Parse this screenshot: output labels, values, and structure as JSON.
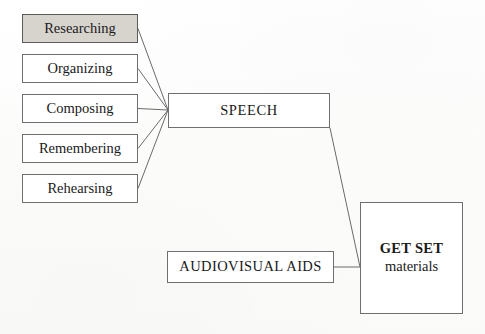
{
  "diagram": {
    "type": "flow-diagram",
    "background_color": "#fdfdfc",
    "line_color": "#6b6b6b",
    "border_color": "#6f6f6f",
    "shaded_fill_color": "#d7d4ce",
    "text_color": "#1a1a1a",
    "stages": [
      {
        "id": "researching",
        "label": "Researching",
        "shaded": true
      },
      {
        "id": "organizing",
        "label": "Organizing",
        "shaded": false
      },
      {
        "id": "composing",
        "label": "Composing",
        "shaded": false
      },
      {
        "id": "remembering",
        "label": "Remembering",
        "shaded": false
      },
      {
        "id": "rehearsing",
        "label": "Rehearsing",
        "shaded": false
      }
    ],
    "speech": {
      "id": "speech",
      "label": "SPEECH"
    },
    "audiovisual": {
      "id": "audiovisual-aids",
      "label": "AUDIOVISUAL AIDS"
    },
    "outcome": {
      "id": "get-set-materials",
      "title": "GET SET",
      "subtitle": "materials"
    }
  }
}
